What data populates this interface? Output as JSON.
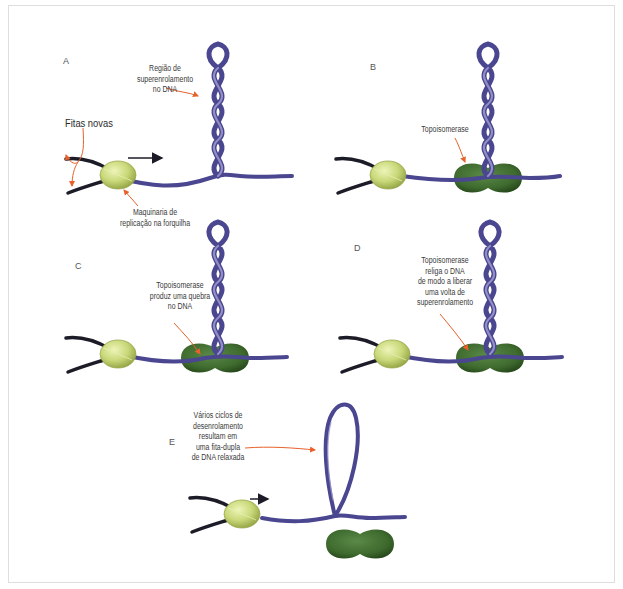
{
  "figure": {
    "colors": {
      "dna_duplex": "#4a4690",
      "dna_highlight": "#9a97cc",
      "new_strands": "#1c1c28",
      "replication_machinery": "#c8d878",
      "topoisomerase": "#3e6a2e",
      "callout_arrow": "#e8602a",
      "frame_border": "#dedede"
    },
    "panels": [
      {
        "id": "A",
        "letter": "A",
        "labels": {
          "supercoil": [
            "Região de",
            "superenrolamento",
            "no DNA"
          ],
          "new_strands": "Fitas novas",
          "machinery": [
            "Maquinaria de",
            "replicação na forquilha"
          ]
        }
      },
      {
        "id": "B",
        "letter": "B",
        "labels": {
          "topoisomerase": "Topoisomerase"
        }
      },
      {
        "id": "C",
        "letter": "C",
        "labels": {
          "topoisomerase": [
            "Topoisomerase",
            "produz uma quebra",
            "no DNA"
          ]
        }
      },
      {
        "id": "D",
        "letter": "D",
        "labels": {
          "topoisomerase": [
            "Topoisomerase",
            "religa o DNA",
            "de modo a liberar",
            "uma volta de",
            "superenrolamento"
          ]
        }
      },
      {
        "id": "E",
        "letter": "E",
        "labels": {
          "relaxed": [
            "Vários ciclos de",
            "desenrolamento",
            "resultam em",
            "uma fita-dupla",
            "de DNA relaxada"
          ]
        }
      }
    ]
  }
}
